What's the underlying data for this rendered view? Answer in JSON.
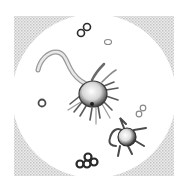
{
  "figure": {
    "subjects": [
      {
        "name": "large-amoeboid-cell-with-tail",
        "count": 1
      },
      {
        "name": "small-stellate-amoeboid-cell",
        "count": 1
      },
      {
        "name": "diplococcus",
        "count": 2
      },
      {
        "name": "single-coccus",
        "count": 2
      },
      {
        "name": "coccus-cluster",
        "count": 1
      }
    ],
    "colors": {
      "background": "#ffffff",
      "frame_shading": "#c8c8c8",
      "ink": "#3a3a3a"
    }
  }
}
